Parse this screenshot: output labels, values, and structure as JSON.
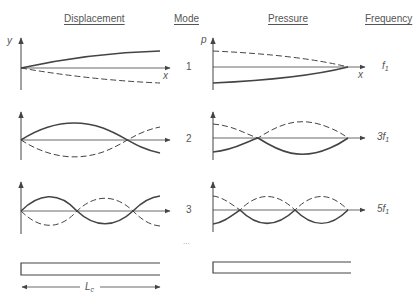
{
  "headers": {
    "displacement": "Displacement",
    "mode": "Mode",
    "pressure": "Pressure",
    "frequency": "Frequency"
  },
  "axes": {
    "displacement_y": "y",
    "displacement_x": "x",
    "pressure_y": "p",
    "pressure_x": "x"
  },
  "modes": [
    {
      "number": "1",
      "frequency": "f",
      "frequency_sub": "1"
    },
    {
      "number": "2",
      "frequency": "3f",
      "frequency_sub": "1"
    },
    {
      "number": "3",
      "frequency": "5f",
      "frequency_sub": "1"
    }
  ],
  "ellipsis": "...",
  "tube": {
    "length_label": "L",
    "length_sub": "c"
  }
}
